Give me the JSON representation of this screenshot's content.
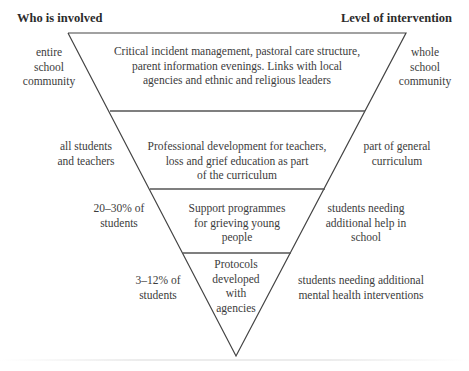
{
  "headers": {
    "left": "Who is involved",
    "right": "Level of intervention"
  },
  "tiers": [
    {
      "who": [
        "entire",
        "school",
        "community"
      ],
      "content": [
        "Critical incident management, pastoral care structure,",
        "parent information evenings. Links with local",
        "agencies and ethnic and religious leaders"
      ],
      "level": [
        "whole",
        "school",
        "community"
      ]
    },
    {
      "who": [
        "all students",
        "and teachers"
      ],
      "content": [
        "Professional development for teachers,",
        "loss and grief education as part",
        "of the curriculum"
      ],
      "level": [
        "part of general",
        "curriculum"
      ]
    },
    {
      "who": [
        "20–30% of",
        "students"
      ],
      "content": [
        "Support programmes",
        "for grieving young",
        "people"
      ],
      "level": [
        "students needing",
        "additional help in",
        "school"
      ]
    },
    {
      "who": [
        "3–12% of",
        "students"
      ],
      "content": [
        "Protocols",
        "developed",
        "with",
        "agencies"
      ],
      "level": [
        "students needing additional",
        "mental health interventions"
      ]
    }
  ],
  "colors": {
    "line": "#444444",
    "text": "#3c3c3c",
    "background": "#ffffff"
  }
}
